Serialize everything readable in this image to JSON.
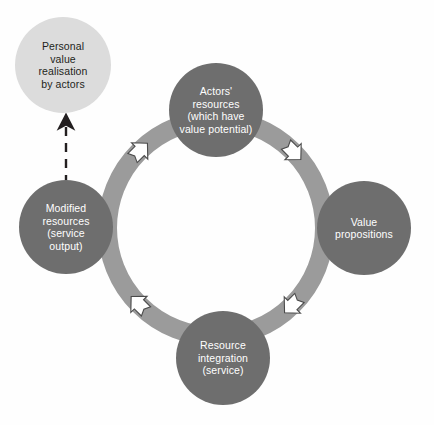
{
  "diagram": {
    "type": "cycle",
    "title": "",
    "direction": "clockwise",
    "background_color": "#fefefe",
    "ring": {
      "name": "value-cocreation-cycle-ring",
      "center_x": 216,
      "center_y": 228,
      "outer_radius": 118,
      "thickness": 19,
      "color": "#9b9b9b"
    },
    "nodes": [
      {
        "id": "actors-resources",
        "label": "Actors'\nresources\n(which have\nvalue potential)",
        "position": "top",
        "cx": 216,
        "cy": 110,
        "r": 47,
        "fill": "#6e6e6e",
        "text_color": "#ffffff"
      },
      {
        "id": "value-propositions",
        "label": "Value\npropositions",
        "position": "right",
        "cx": 364,
        "cy": 228,
        "r": 47,
        "fill": "#6e6e6e",
        "text_color": "#ffffff"
      },
      {
        "id": "resource-integration",
        "label": "Resource\nintegration\n(service)",
        "position": "bottom",
        "cx": 223,
        "cy": 358,
        "r": 47,
        "fill": "#6e6e6e",
        "text_color": "#ffffff"
      },
      {
        "id": "modified-resources",
        "label": "Modified\nresources\n(service\noutput)",
        "position": "left",
        "cx": 66,
        "cy": 227,
        "r": 47,
        "fill": "#6e6e6e",
        "text_color": "#ffffff"
      },
      {
        "id": "personal-value-realisation",
        "label": "Personal\nvalue\nrealisation\nby actors",
        "position": "top-left-outside",
        "cx": 63,
        "cy": 65,
        "r": 48,
        "fill": "#dcdcdc",
        "text_color": "#231f20"
      }
    ],
    "flow_arrows": [
      {
        "id": "arrow-modified-to-actors",
        "name": "flow-arrow-upper-left",
        "angle_deg": 225,
        "direction": "clockwise"
      },
      {
        "id": "arrow-actors-to-value",
        "name": "flow-arrow-upper-right",
        "angle_deg": 315,
        "direction": "clockwise"
      },
      {
        "id": "arrow-value-to-resource",
        "name": "flow-arrow-lower-right",
        "angle_deg": 45,
        "direction": "clockwise"
      },
      {
        "id": "arrow-resource-to-modified",
        "name": "flow-arrow-lower-left",
        "angle_deg": 135,
        "direction": "clockwise"
      }
    ],
    "dashed_arrow": {
      "id": "arrow-modified-to-personal-value",
      "name": "dashed-outcome-arrow",
      "color": "#231f20",
      "from": "modified-resources",
      "to": "personal-value-realisation",
      "style": "dashed",
      "x": 66,
      "y_start": 182,
      "y_end": 118
    }
  }
}
